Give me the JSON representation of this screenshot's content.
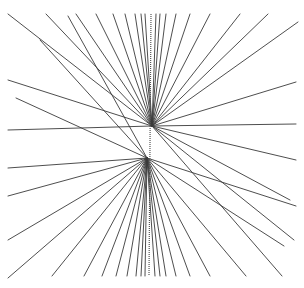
{
  "figure": {
    "width": 304,
    "height": 288,
    "line_color": "#3a3a3a",
    "background": "#ffffff",
    "upper_focus": [
      152,
      126
    ],
    "lower_focus": [
      147,
      158
    ],
    "axis": {
      "x_top": 151,
      "x_bottom": 149,
      "y_top": 14,
      "y_bottom": 276
    },
    "upper_fan_endpoints": [
      [
        8,
        14
      ],
      [
        46,
        14
      ],
      [
        76,
        14
      ],
      [
        96,
        14
      ],
      [
        113,
        14
      ],
      [
        125,
        14
      ],
      [
        135,
        14
      ],
      [
        141,
        14
      ],
      [
        145,
        14
      ],
      [
        156,
        14
      ],
      [
        160,
        14
      ],
      [
        166,
        14
      ],
      [
        176,
        14
      ],
      [
        190,
        14
      ],
      [
        210,
        14
      ],
      [
        240,
        14
      ],
      [
        268,
        14
      ],
      [
        298,
        22
      ],
      [
        296,
        82
      ],
      [
        296,
        124
      ],
      [
        296,
        160
      ],
      [
        290,
        200
      ],
      [
        294,
        240
      ],
      [
        282,
        276
      ],
      [
        8,
        80
      ],
      [
        8,
        130
      ]
    ],
    "lower_fan_endpoints": [
      [
        8,
        196
      ],
      [
        8,
        240
      ],
      [
        8,
        278
      ],
      [
        52,
        276
      ],
      [
        84,
        276
      ],
      [
        102,
        276
      ],
      [
        116,
        276
      ],
      [
        127,
        276
      ],
      [
        136,
        276
      ],
      [
        141,
        276
      ],
      [
        145,
        276
      ],
      [
        155,
        276
      ],
      [
        160,
        276
      ],
      [
        166,
        276
      ],
      [
        176,
        276
      ],
      [
        190,
        276
      ],
      [
        210,
        276
      ],
      [
        246,
        276
      ],
      [
        284,
        246
      ],
      [
        296,
        206
      ],
      [
        8,
        168
      ],
      [
        16,
        98
      ],
      [
        40,
        40
      ],
      [
        68,
        16
      ]
    ]
  }
}
